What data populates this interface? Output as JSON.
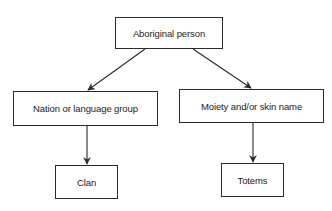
{
  "diagram": {
    "type": "hierarchy",
    "nodes": {
      "root": {
        "label": "Aboriginal person"
      },
      "nation": {
        "label": "Nation or language group"
      },
      "moiety": {
        "label": "Moiety and/or skin name"
      },
      "clan": {
        "label": "Clan"
      },
      "totems": {
        "label": "Totems"
      }
    },
    "edges": [
      {
        "from": "Aboriginal person",
        "to": "Nation or language group"
      },
      {
        "from": "Aboriginal person",
        "to": "Moiety and/or skin name"
      },
      {
        "from": "Nation or language group",
        "to": "Clan"
      },
      {
        "from": "Moiety and/or skin name",
        "to": "Totems"
      }
    ],
    "colors": {
      "stroke": "#2a2a2a",
      "text": "#222222",
      "background": "#ffffff"
    }
  }
}
